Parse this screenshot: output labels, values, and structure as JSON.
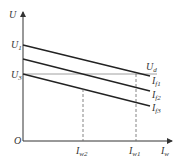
{
  "diagram": {
    "type": "voltage-current characteristic",
    "axes": {
      "y_label": "U",
      "x_label": {
        "base": "I",
        "sub": "w"
      },
      "origin_label": "O"
    },
    "y_ticks": [
      {
        "base": "U",
        "sub": "1"
      },
      {
        "base": "U",
        "sub": "3"
      }
    ],
    "x_ticks": [
      {
        "base": "I",
        "sub": "w2"
      },
      {
        "base": "I",
        "sub": "w1"
      }
    ],
    "lines": [
      {
        "base": "I",
        "sub": "f1"
      },
      {
        "base": "I",
        "sub": "f2"
      },
      {
        "base": "I",
        "sub": "f3"
      }
    ],
    "reference_line": {
      "base": "U",
      "sub": "d"
    },
    "colors": {
      "line": "#222222",
      "axis": "#333333",
      "dashed": "#666666",
      "ref": "#888888"
    }
  }
}
